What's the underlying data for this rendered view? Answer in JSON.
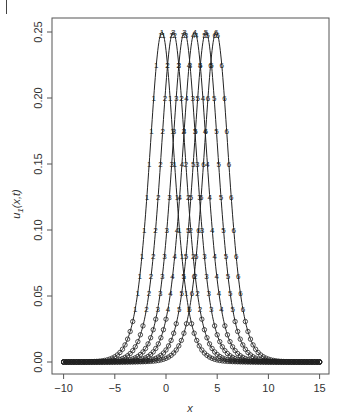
{
  "chart_data": {
    "type": "line",
    "title": "",
    "xlabel": "x",
    "ylabel": "u1(x,t)",
    "ylabel_main": "u",
    "ylabel_sub": "1",
    "ylabel_args": "(x,t)",
    "xlim": [
      -10,
      15
    ],
    "ylim": [
      0,
      0.25
    ],
    "grid": false,
    "legend": "none",
    "xticks": [
      -10,
      -5,
      0,
      5,
      10,
      15
    ],
    "xtick_labels": [
      "−10",
      "−5",
      "0",
      "5",
      "10",
      "15"
    ],
    "yticks": [
      0.0,
      0.05,
      0.1,
      0.15,
      0.2,
      0.25
    ],
    "ytick_labels": [
      "0.00",
      "0.05",
      "0.10",
      "0.15",
      "0.20",
      "0.25"
    ],
    "x_range_data": [
      -10,
      15
    ],
    "series": [
      {
        "name": "1",
        "label": "1",
        "peak": 0.25,
        "center": -0.4,
        "width_k": 0.6
      },
      {
        "name": "2",
        "label": "2",
        "peak": 0.25,
        "center": 0.7,
        "width_k": 0.6
      },
      {
        "name": "3",
        "label": "3",
        "peak": 0.25,
        "center": 1.8,
        "width_k": 0.6
      },
      {
        "name": "4",
        "label": "4",
        "peak": 0.25,
        "center": 2.8,
        "width_k": 0.6
      },
      {
        "name": "5",
        "label": "5",
        "peak": 0.25,
        "center": 3.9,
        "width_k": 0.6
      },
      {
        "name": "6",
        "label": "6",
        "peak": 0.25,
        "center": 4.9,
        "width_k": 0.6
      }
    ],
    "marker_rows_u": [
      0.248,
      0.225,
      0.2,
      0.175,
      0.15,
      0.125,
      0.1,
      0.08,
      0.065,
      0.052,
      0.04
    ]
  },
  "colors": {
    "line": "#222222",
    "axis": "#555555",
    "text": "#333333"
  }
}
